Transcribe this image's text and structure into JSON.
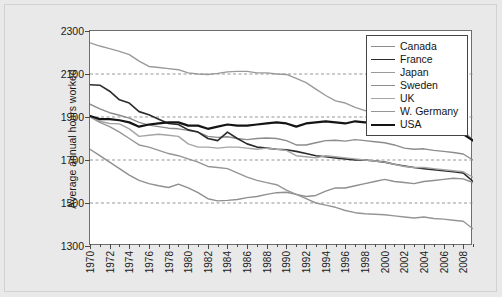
{
  "chart_data": {
    "type": "line",
    "title": "",
    "xlabel": "",
    "ylabel": "Average annual hours worked",
    "ylim": [
      1300,
      2300
    ],
    "xlim": [
      1970,
      2009
    ],
    "yticks": [
      1300,
      1500,
      1700,
      1900,
      2100,
      2300
    ],
    "ytick_labels": [
      "1300",
      "1500",
      "1700",
      "1900",
      "2100",
      "2300"
    ],
    "gridlines": {
      "horizontal_dashed_at": [
        1500,
        1700,
        1900,
        2100
      ],
      "vertical": false
    },
    "legend_position": "top-right",
    "xtick_labels": [
      "1970",
      "1972",
      "1974",
      "1976",
      "1978",
      "1980",
      "1982",
      "1984",
      "1986",
      "1988",
      "1990",
      "1992",
      "1994",
      "1996",
      "1998",
      "2000",
      "2002",
      "2004",
      "2006",
      "2008"
    ],
    "x": [
      1970,
      1971,
      1972,
      1973,
      1974,
      1975,
      1976,
      1977,
      1978,
      1979,
      1980,
      1981,
      1982,
      1983,
      1984,
      1985,
      1986,
      1987,
      1988,
      1989,
      1990,
      1991,
      1992,
      1993,
      1994,
      1995,
      1996,
      1997,
      1998,
      1999,
      2000,
      2001,
      2002,
      2003,
      2004,
      2005,
      2006,
      2007,
      2008,
      2009
    ],
    "series": [
      {
        "name": "Canada",
        "color": "#8c8c8c",
        "width": 1.4,
        "values": [
          1960,
          1938,
          1920,
          1908,
          1895,
          1875,
          1862,
          1855,
          1848,
          1845,
          1838,
          1830,
          1810,
          1805,
          1808,
          1800,
          1795,
          1800,
          1802,
          1800,
          1790,
          1770,
          1770,
          1780,
          1790,
          1792,
          1788,
          1795,
          1790,
          1785,
          1780,
          1770,
          1755,
          1750,
          1752,
          1745,
          1740,
          1735,
          1728,
          1700
        ]
      },
      {
        "name": "France",
        "color": "#2b2b2b",
        "width": 1.6,
        "values": [
          2050,
          2048,
          2020,
          1980,
          1965,
          1925,
          1910,
          1890,
          1870,
          1865,
          1840,
          1830,
          1800,
          1790,
          1830,
          1800,
          1775,
          1760,
          1755,
          1750,
          1748,
          1740,
          1730,
          1720,
          1715,
          1710,
          1705,
          1700,
          1700,
          1695,
          1690,
          1680,
          1672,
          1665,
          1660,
          1655,
          1650,
          1645,
          1640,
          1600
        ]
      },
      {
        "name": "Japan",
        "color": "#9a9a9a",
        "width": 1.4,
        "values": [
          2245,
          2230,
          2218,
          2205,
          2190,
          2160,
          2135,
          2130,
          2125,
          2120,
          2105,
          2100,
          2098,
          2103,
          2110,
          2112,
          2112,
          2105,
          2105,
          2100,
          2098,
          2080,
          2060,
          2030,
          2000,
          1975,
          1965,
          1945,
          1930,
          1920,
          1910,
          1895,
          1885,
          1880,
          1878,
          1872,
          1865,
          1855,
          1840,
          1790
        ]
      },
      {
        "name": "Sweden",
        "color": "#8f8f8f",
        "width": 1.4,
        "values": [
          1750,
          1720,
          1690,
          1660,
          1630,
          1605,
          1590,
          1580,
          1572,
          1588,
          1570,
          1548,
          1520,
          1510,
          1512,
          1516,
          1525,
          1530,
          1540,
          1548,
          1550,
          1540,
          1530,
          1535,
          1555,
          1570,
          1570,
          1580,
          1590,
          1600,
          1610,
          1600,
          1595,
          1590,
          1600,
          1605,
          1610,
          1615,
          1612,
          1595
        ]
      },
      {
        "name": "UK",
        "color": "#a5a5a5",
        "width": 1.4,
        "values": [
          1905,
          1880,
          1870,
          1868,
          1845,
          1810,
          1815,
          1820,
          1815,
          1810,
          1775,
          1760,
          1760,
          1755,
          1760,
          1760,
          1755,
          1750,
          1755,
          1750,
          1745,
          1720,
          1715,
          1710,
          1720,
          1715,
          1710,
          1705,
          1700,
          1695,
          1690,
          1680,
          1670,
          1665,
          1665,
          1660,
          1655,
          1650,
          1645,
          1620
        ]
      },
      {
        "name": "W. Germany",
        "color": "#959595",
        "width": 1.4,
        "values": [
          1900,
          1875,
          1855,
          1830,
          1800,
          1770,
          1760,
          1745,
          1730,
          1720,
          1705,
          1690,
          1670,
          1665,
          1660,
          1640,
          1620,
          1605,
          1595,
          1585,
          1560,
          1540,
          1520,
          1500,
          1490,
          1480,
          1465,
          1455,
          1450,
          1448,
          1445,
          1440,
          1435,
          1430,
          1435,
          1428,
          1425,
          1420,
          1415,
          1380
        ]
      },
      {
        "name": "USA",
        "color": "#141414",
        "width": 2.2,
        "values": [
          1905,
          1890,
          1890,
          1885,
          1875,
          1855,
          1865,
          1870,
          1875,
          1875,
          1860,
          1860,
          1845,
          1855,
          1865,
          1860,
          1860,
          1865,
          1870,
          1875,
          1870,
          1855,
          1870,
          1875,
          1880,
          1875,
          1870,
          1880,
          1875,
          1875,
          1870,
          1850,
          1840,
          1835,
          1835,
          1830,
          1830,
          1825,
          1820,
          1790
        ]
      }
    ]
  },
  "legend": {
    "items": [
      {
        "label": "Canada"
      },
      {
        "label": "France"
      },
      {
        "label": "Japan"
      },
      {
        "label": "Sweden"
      },
      {
        "label": "UK"
      },
      {
        "label": "W. Germany"
      },
      {
        "label": "USA"
      }
    ]
  }
}
